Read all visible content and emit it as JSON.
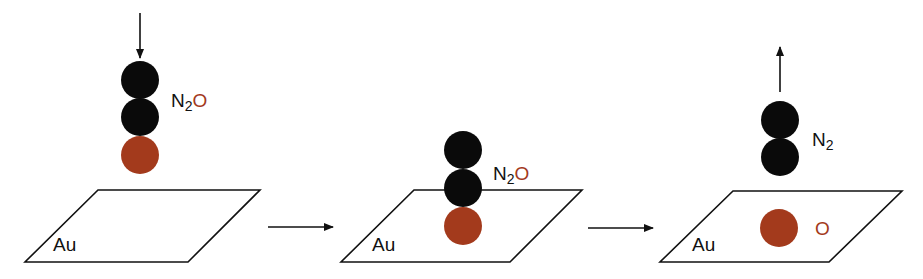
{
  "colors": {
    "nitrogen": "#0a0a0a",
    "oxygen": "#a33a1c",
    "oxygen_label": "#a33a1c",
    "line": "#111111"
  },
  "panels": [
    {
      "surface_label": "Au",
      "molecule": {
        "symbol_main": "N",
        "subscript": "2",
        "suffix": "O"
      },
      "motion": "approaching"
    },
    {
      "surface_label": "Au",
      "molecule": {
        "symbol_main": "N",
        "subscript": "2",
        "suffix": "O"
      },
      "motion": "adsorbed"
    },
    {
      "surface_label": "Au",
      "molecule": {
        "symbol_main": "N",
        "subscript": "2",
        "suffix": ""
      },
      "adsorbate_label": "O",
      "motion": "desorbing"
    }
  ]
}
